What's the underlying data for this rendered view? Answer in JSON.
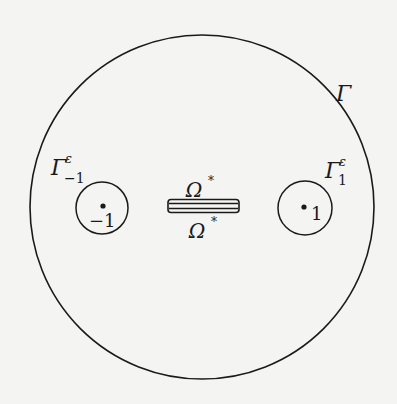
{
  "diagram": {
    "outer_boundary": {
      "label": "Γ",
      "center": [
        202,
        207
      ],
      "radius": 172
    },
    "left_hole": {
      "label": "Γ",
      "superscript": "ε",
      "subscript": "−1",
      "point_label": "−1",
      "center": [
        102,
        208
      ],
      "radius": 26
    },
    "right_hole": {
      "label": "Γ",
      "superscript": "ε",
      "subscript": "1",
      "point_label": "1",
      "center": [
        305,
        208
      ],
      "radius": 27
    },
    "slot": {
      "label_top": "Ω",
      "label_top_sup": "*",
      "label_bottom": "Ω",
      "label_bottom_sup": "*"
    },
    "colors": {
      "stroke": "#1a1a1a",
      "background": "#f4f4f2"
    }
  }
}
